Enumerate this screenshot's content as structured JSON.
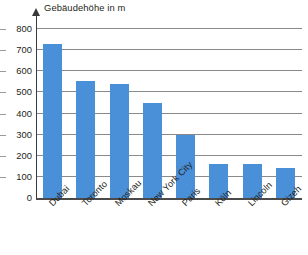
{
  "chart_data": {
    "type": "bar",
    "title": "Gebäudehöhe in m",
    "xlabel": "",
    "ylabel": "Gebäudehöhe in m",
    "ylim": [
      0,
      800
    ],
    "ytick_step": 100,
    "yticks": [
      0,
      100,
      200,
      300,
      400,
      500,
      600,
      700,
      800
    ],
    "ytick_labels": [
      "0",
      "100",
      "200",
      "300",
      "400",
      "500",
      "600",
      "700",
      "800"
    ],
    "grid": true,
    "legend": false,
    "legend_position": "none",
    "bar_color": "#4a90d9",
    "categories": [
      "Dubai",
      "Toronto",
      "Moskau",
      "New York City",
      "Paris",
      "Köln",
      "Lincoln",
      "Gizeh"
    ],
    "values": [
      730,
      553,
      540,
      450,
      300,
      160,
      160,
      140
    ],
    "series": [
      {
        "name": "Gebäudehöhe in m",
        "values": [
          730,
          553,
          540,
          450,
          300,
          160,
          160,
          140
        ]
      }
    ]
  },
  "axis": {
    "title": "Gebäudehöhe in m",
    "arrow_icon": "up-arrow-icon"
  }
}
